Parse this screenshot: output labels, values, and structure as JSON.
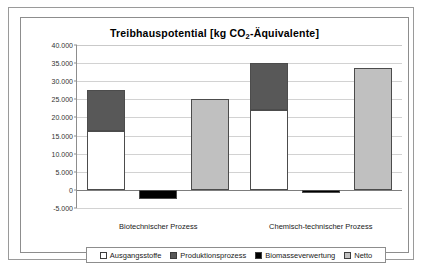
{
  "chart_data": {
    "type": "bar",
    "title": "Treibhauspotential [kg CO2-Äquivalente]",
    "title_parts": {
      "before": "Treibhauspotential [kg CO",
      "sub": "2",
      "after": "-Äquivalente]"
    },
    "xlabel": "",
    "ylabel": "",
    "ylim": [
      -5000,
      40000
    ],
    "ytick_step": 5000,
    "grid": true,
    "legend_position": "bottom",
    "ytick_labels": [
      "40.000",
      "35.000",
      "30.000",
      "25.000",
      "20.000",
      "15.000",
      "10.000",
      "5.000",
      "0",
      "-5.000"
    ],
    "ytick_values": [
      40000,
      35000,
      30000,
      25000,
      20000,
      15000,
      10000,
      5000,
      0,
      -5000
    ],
    "categories": [
      "Biotechnischer Prozess",
      "Chemisch-technischer Prozess"
    ],
    "series": [
      {
        "name": "Ausgangsstoffe",
        "color": "#ffffff",
        "stacked": true,
        "values": [
          16300,
          22100
        ]
      },
      {
        "name": "Produktionsprozess",
        "color": "#585858",
        "stacked": true,
        "values": [
          11200,
          12900
        ]
      },
      {
        "name": "Biomasseverwertung",
        "color": "#000000",
        "stacked": false,
        "values": [
          -2400,
          -800
        ]
      },
      {
        "name": "Netto",
        "color": "#c0c0c0",
        "stacked": false,
        "values": [
          25000,
          33700
        ]
      }
    ],
    "stack_totals": [
      27500,
      35000
    ]
  },
  "legend": {
    "items": [
      {
        "label": "Ausgangsstoffe",
        "color": "#ffffff"
      },
      {
        "label": "Produktionsprozess",
        "color": "#585858"
      },
      {
        "label": "Biomasseverwertung",
        "color": "#000000"
      },
      {
        "label": "Netto",
        "color": "#c0c0c0"
      }
    ]
  }
}
